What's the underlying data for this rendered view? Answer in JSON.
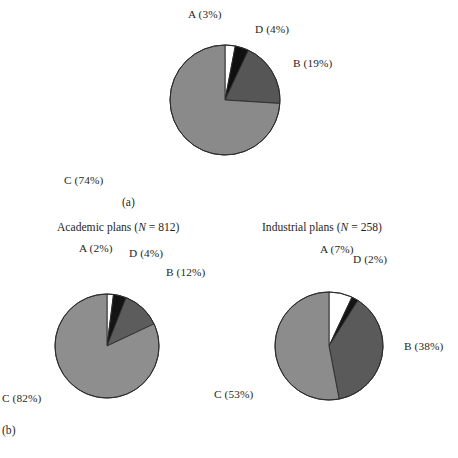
{
  "figure": {
    "panel_a_caption": "(a)",
    "panel_b_caption": "(b)"
  },
  "chart_data": [
    {
      "type": "pie",
      "id": "overall",
      "title": "",
      "panel": "(a)",
      "categories": [
        "A",
        "B",
        "C",
        "D"
      ],
      "slice_order": [
        "A",
        "D",
        "B",
        "C"
      ],
      "values": [
        3,
        19,
        74,
        4
      ],
      "unit": "%",
      "start_angle_deg": 0,
      "direction": "clockwise",
      "labels": {
        "A": "A (3%)",
        "D": "D (4%)",
        "B": "B (19%)",
        "C": "C (74%)"
      },
      "slices": [
        {
          "key": "A",
          "label": "A (3%)",
          "value": 3,
          "color": "#ffffff"
        },
        {
          "key": "D",
          "label": "D (4%)",
          "value": 4,
          "color": "#101010"
        },
        {
          "key": "B",
          "label": "B (19%)",
          "value": 19,
          "color": "#565656"
        },
        {
          "key": "C",
          "label": "C (74%)",
          "value": 74,
          "color": "#8a8a8a"
        }
      ]
    },
    {
      "type": "pie",
      "id": "academic",
      "title": "Academic plans (N = 812)",
      "title_prefix": "Academic plans (",
      "title_italic": "N",
      "title_suffix": " = 812)",
      "panel": "(b)",
      "n": 812,
      "categories": [
        "A",
        "B",
        "C",
        "D"
      ],
      "slice_order": [
        "A",
        "D",
        "B",
        "C"
      ],
      "values": [
        2,
        12,
        82,
        4
      ],
      "unit": "%",
      "start_angle_deg": 0,
      "direction": "clockwise",
      "labels": {
        "A": "A (2%)",
        "D": "D (4%)",
        "B": "B (12%)",
        "C": "C (82%)"
      },
      "slices": [
        {
          "key": "A",
          "label": "A (2%)",
          "value": 2,
          "color": "#ffffff"
        },
        {
          "key": "D",
          "label": "D (4%)",
          "value": 4,
          "color": "#141414"
        },
        {
          "key": "B",
          "label": "B (12%)",
          "value": 12,
          "color": "#5c5c5c"
        },
        {
          "key": "C",
          "label": "C (82%)",
          "value": 82,
          "color": "#8e8e8e"
        }
      ]
    },
    {
      "type": "pie",
      "id": "industrial",
      "title": "Industrial plans (N = 258)",
      "title_prefix": "Industrial plans (",
      "title_italic": "N",
      "title_suffix": " = 258)",
      "panel": "(b)",
      "n": 258,
      "categories": [
        "A",
        "B",
        "C",
        "D"
      ],
      "slice_order": [
        "A",
        "D",
        "B",
        "C"
      ],
      "values": [
        7,
        38,
        53,
        2
      ],
      "unit": "%",
      "start_angle_deg": 0,
      "direction": "clockwise",
      "labels": {
        "A": "A (7%)",
        "D": "D (2%)",
        "B": "B (38%)",
        "C": "C (53%)"
      },
      "slices": [
        {
          "key": "A",
          "label": "A (7%)",
          "value": 7,
          "color": "#ffffff"
        },
        {
          "key": "D",
          "label": "D (2%)",
          "value": 2,
          "color": "#141414"
        },
        {
          "key": "B",
          "label": "B (38%)",
          "value": 38,
          "color": "#5a5a5a"
        },
        {
          "key": "C",
          "label": "C (53%)",
          "value": 53,
          "color": "#8c8c8c"
        }
      ]
    }
  ],
  "geometry": {
    "pie_a_radius": 55,
    "pie_bl_radius": 52,
    "pie_br_radius": 54
  },
  "colors": {
    "slice_a": "#ffffff",
    "slice_b": "#585858",
    "slice_c": "#8c8c8c",
    "slice_d": "#121212",
    "outline": "#2b2b2b",
    "text": "#1f1f1f",
    "background": "#ffffff"
  }
}
